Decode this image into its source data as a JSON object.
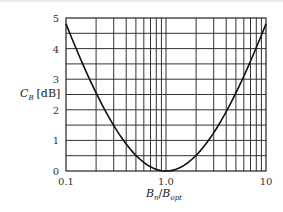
{
  "chart_data": {
    "type": "line",
    "title": "",
    "xlabel": "B_n / B_opt",
    "ylabel": "C_B [dB]",
    "xscale": "log",
    "xlim": [
      0.1,
      10
    ],
    "ylim": [
      0,
      5
    ],
    "grid": true,
    "x_tick_labels": [
      "0.1",
      "1.0",
      "10"
    ],
    "y_tick_labels": [
      "0",
      "1",
      "2",
      "3",
      "4",
      "5"
    ],
    "series": [
      {
        "name": "C_B",
        "x": [
          0.1,
          0.15,
          0.2,
          0.3,
          0.4,
          0.5,
          0.6,
          0.7,
          0.8,
          0.9,
          1.0,
          1.5,
          2,
          3,
          4,
          5,
          6,
          7,
          8,
          9,
          10
        ],
        "y": [
          4.81,
          3.67,
          2.55,
          1.46,
          0.87,
          0.51,
          0.28,
          0.14,
          0.05,
          0.01,
          0.0,
          0.18,
          0.51,
          1.25,
          1.94,
          2.55,
          3.1,
          3.58,
          4.0,
          4.44,
          4.81
        ]
      }
    ]
  },
  "labels": {
    "y_axis": "C",
    "y_axis_sub": "B",
    "y_axis_unit": "[dB]",
    "x_axis_num": "B",
    "x_axis_num_sub": "n",
    "x_axis_sep": "/",
    "x_axis_den": "B",
    "x_axis_den_sub": "opt",
    "x_ticks": [
      "0.1",
      "1.0",
      "10"
    ],
    "y_ticks": [
      "0",
      "1",
      "2",
      "3",
      "4",
      "5"
    ]
  }
}
